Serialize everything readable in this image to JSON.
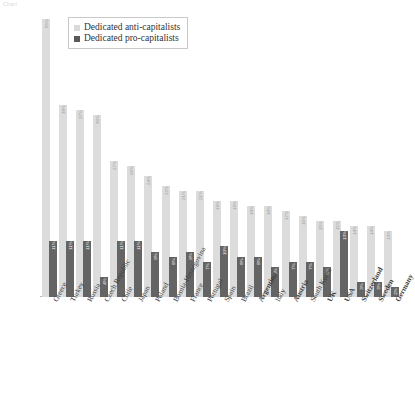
{
  "corner_note": "Chart",
  "legend": {
    "position": "top-left-inside",
    "items": [
      {
        "label": "Dedicated anti-capitalists",
        "color": "#d9d9d9",
        "key": "anti"
      },
      {
        "label": "Dedicated pro-capitalists",
        "color": "#595959",
        "key": "pro"
      }
    ]
  },
  "chart_data": {
    "type": "bar",
    "title": "",
    "subtitle": "",
    "xlabel": "",
    "ylabel": "",
    "ylim": [
      0,
      56
    ],
    "grid": false,
    "legend_position": "top-left-inside",
    "orientation": "vertical",
    "grouping": "grouped",
    "categories": [
      "Greece",
      "Turkey",
      "Russia",
      "Czech Republic",
      "Chile",
      "Japan",
      "Poland",
      "Bosnia-Herzegovina",
      "France",
      "Portugal",
      "Spain",
      "Brazil",
      "Argentina",
      "Italy",
      "Austria",
      "South Korea",
      "UK",
      "USA",
      "Switzerland",
      "Sweden",
      "Germany"
    ],
    "bold_categories": [
      "Argentina",
      "Austria",
      "UK",
      "USA",
      "Switzerland",
      "Sweden",
      "Germany"
    ],
    "series": [
      {
        "name": "Dedicated anti-capitalists",
        "color": "#d9d9d9",
        "values": [
          55,
          38,
          37,
          36,
          27,
          26,
          24,
          22,
          21,
          21,
          19,
          19,
          18,
          18,
          17,
          16,
          15,
          15,
          14,
          14,
          13
        ]
      },
      {
        "name": "Dedicated pro-capitalists",
        "color": "#595959",
        "values": [
          11,
          11,
          11,
          4,
          11,
          11,
          9,
          8,
          9,
          7,
          10,
          8,
          8,
          6,
          7,
          7,
          6,
          13,
          3,
          3,
          2
        ]
      }
    ]
  }
}
